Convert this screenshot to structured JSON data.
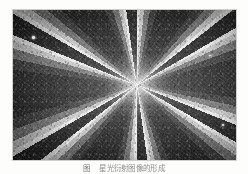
{
  "figure": {
    "alt_description": "Dark grainy photographic plate showing a twelve-pointed radial star-burst flare centred slightly right of middle",
    "plate": {
      "ray_count": 12,
      "center_x_pct": 55.5,
      "center_y_pct": 50,
      "background_color": "#0d0d0d",
      "ray_color": "#ffffff",
      "specks": [
        {
          "x_pct": 8.5,
          "y_pct": 17.5,
          "size_px": 2.6
        },
        {
          "x_pct": 93.5,
          "y_pct": 76.0,
          "size_px": 2.2
        },
        {
          "x_pct": 78.0,
          "y_pct": 19.0,
          "size_px": 1.6
        },
        {
          "x_pct": 24.0,
          "y_pct": 88.0,
          "size_px": 1.5
        },
        {
          "x_pct": 60.0,
          "y_pct": 90.0,
          "size_px": 1.4
        },
        {
          "x_pct": 88.0,
          "y_pct": 30.0,
          "size_px": 1.3
        }
      ]
    }
  },
  "caption": {
    "number": "图",
    "text": "星光衍射图像的形成"
  },
  "page": {
    "background_color": "#fdfdfb"
  }
}
